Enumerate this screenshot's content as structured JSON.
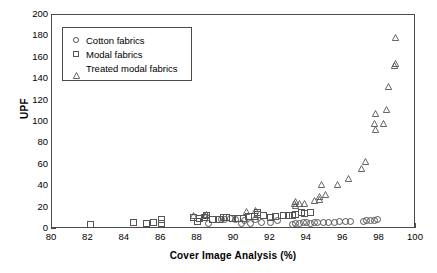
{
  "chart_data": {
    "type": "scatter",
    "title": "",
    "xlabel": "Cover Image Analysis (%)",
    "ylabel": "UPF",
    "xlim": [
      80,
      100
    ],
    "ylim": [
      0,
      200
    ],
    "xticks": [
      80,
      82,
      84,
      86,
      88,
      90,
      92,
      94,
      96,
      98,
      100
    ],
    "yticks": [
      0,
      20,
      40,
      60,
      80,
      100,
      120,
      140,
      160,
      180,
      200
    ],
    "grid": false,
    "legend_position": "upper-left-inside",
    "marker_color": "#555555",
    "axis_color": "#4a4a4a",
    "series": [
      {
        "name": "Cotton fabrics",
        "marker": "circle",
        "points": [
          [
            88.6,
            5.0
          ],
          [
            89.3,
            9.0
          ],
          [
            89.5,
            8.5
          ],
          [
            89.8,
            9.5
          ],
          [
            90.1,
            8.5
          ],
          [
            90.4,
            5.0
          ],
          [
            90.6,
            8.0
          ],
          [
            90.9,
            5.5
          ],
          [
            91.2,
            9.0
          ],
          [
            91.5,
            6.0
          ],
          [
            92.0,
            6.0
          ],
          [
            92.4,
            7.5
          ],
          [
            93.2,
            4.5
          ],
          [
            93.4,
            5.0
          ],
          [
            93.6,
            5.5
          ],
          [
            93.8,
            6.0
          ],
          [
            94.0,
            6.0
          ],
          [
            94.2,
            5.5
          ],
          [
            94.4,
            6.0
          ],
          [
            94.6,
            6.5
          ],
          [
            94.9,
            6.5
          ],
          [
            95.2,
            6.5
          ],
          [
            95.5,
            6.5
          ],
          [
            95.8,
            7.0
          ],
          [
            96.1,
            7.0
          ],
          [
            96.4,
            7.0
          ],
          [
            97.1,
            7.0
          ],
          [
            97.3,
            7.5
          ],
          [
            97.5,
            7.5
          ],
          [
            97.7,
            8.0
          ],
          [
            97.9,
            8.5
          ]
        ]
      },
      {
        "name": "Modal fabrics",
        "marker": "square",
        "points": [
          [
            82.1,
            4.5
          ],
          [
            84.5,
            6.0
          ],
          [
            85.2,
            5.5
          ],
          [
            85.6,
            6.0
          ],
          [
            86.0,
            5.0
          ],
          [
            86.0,
            9.0
          ],
          [
            87.8,
            11.0
          ],
          [
            88.0,
            7.0
          ],
          [
            88.1,
            9.5
          ],
          [
            88.4,
            11.0
          ],
          [
            88.5,
            12.5
          ],
          [
            88.8,
            9.0
          ],
          [
            89.2,
            8.5
          ],
          [
            89.4,
            10.5
          ],
          [
            89.6,
            11.0
          ],
          [
            89.9,
            9.5
          ],
          [
            90.2,
            9.5
          ],
          [
            90.5,
            10.0
          ],
          [
            90.8,
            12.0
          ],
          [
            91.1,
            12.0
          ],
          [
            91.3,
            14.0
          ],
          [
            91.3,
            15.5
          ],
          [
            91.6,
            12.5
          ],
          [
            92.0,
            11.0
          ],
          [
            92.3,
            12.0
          ],
          [
            92.7,
            13.0
          ],
          [
            93.0,
            13.0
          ],
          [
            93.2,
            12.5
          ],
          [
            93.4,
            13.5
          ],
          [
            93.7,
            15.0
          ],
          [
            93.9,
            14.5
          ],
          [
            94.2,
            15.5
          ]
        ]
      },
      {
        "name": "Treated modal fabrics",
        "marker": "triangle",
        "points": [
          [
            87.8,
            12.5
          ],
          [
            88.4,
            13.0
          ],
          [
            88.5,
            14.0
          ],
          [
            90.7,
            16.5
          ],
          [
            91.2,
            17.5
          ],
          [
            93.3,
            24.0
          ],
          [
            93.4,
            25.5
          ],
          [
            93.4,
            22.0
          ],
          [
            93.6,
            23.5
          ],
          [
            93.9,
            23.5
          ],
          [
            94.4,
            27.0
          ],
          [
            94.7,
            30.0
          ],
          [
            94.7,
            28.0
          ],
          [
            94.8,
            41.5
          ],
          [
            95.0,
            32.0
          ],
          [
            95.7,
            41.5
          ],
          [
            96.3,
            47.5
          ],
          [
            97.0,
            57.0
          ],
          [
            97.2,
            63.0
          ],
          [
            97.7,
            99.0
          ],
          [
            97.75,
            93.0
          ],
          [
            97.8,
            108.0
          ],
          [
            98.2,
            99.0
          ],
          [
            98.4,
            112.0
          ],
          [
            98.5,
            133.0
          ],
          [
            98.8,
            153.0
          ],
          [
            98.85,
            155.0
          ],
          [
            98.9,
            179.0
          ]
        ]
      }
    ]
  },
  "legend": {
    "entries": [
      {
        "label": "Cotton fabrics",
        "marker": "circle"
      },
      {
        "label": "Modal fabrics",
        "marker": "square"
      },
      {
        "label": "Treated modal fabrics",
        "marker": "triangle"
      }
    ]
  }
}
